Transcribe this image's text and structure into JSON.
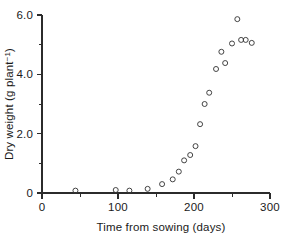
{
  "chart_data": {
    "type": "scatter",
    "title": "",
    "xlabel": "Time from sowing (days)",
    "ylabel": "Dry weight (g plant ⁻¹)",
    "ylabel_main": "Dry weight (g plant",
    "ylabel_sup": "−1",
    "ylabel_tail": ")",
    "xlim": [
      0,
      300
    ],
    "ylim": [
      0,
      6.0
    ],
    "grid": false,
    "legend": "none",
    "marker_style": "open-circle",
    "x_ticks_major": [
      0,
      100,
      200,
      300
    ],
    "x_ticklabels": [
      "0",
      "100",
      "200",
      "300"
    ],
    "x_ticks_minor": [
      50,
      150,
      250
    ],
    "y_ticks_major": [
      0,
      2.0,
      4.0,
      6.0
    ],
    "y_ticklabels": [
      "0",
      "2.0",
      "4.0",
      "6.0"
    ],
    "y_ticks_minor": [
      1.0,
      3.0,
      5.0
    ],
    "points": [
      {
        "x": 44,
        "y": 0.08
      },
      {
        "x": 97,
        "y": 0.1
      },
      {
        "x": 115,
        "y": 0.08
      },
      {
        "x": 139,
        "y": 0.14
      },
      {
        "x": 158,
        "y": 0.3
      },
      {
        "x": 172,
        "y": 0.46
      },
      {
        "x": 180,
        "y": 0.72
      },
      {
        "x": 187,
        "y": 1.1
      },
      {
        "x": 195,
        "y": 1.28
      },
      {
        "x": 202,
        "y": 1.58
      },
      {
        "x": 208,
        "y": 2.32
      },
      {
        "x": 214,
        "y": 3.0
      },
      {
        "x": 220,
        "y": 3.38
      },
      {
        "x": 229,
        "y": 4.18
      },
      {
        "x": 236,
        "y": 4.76
      },
      {
        "x": 241,
        "y": 4.38
      },
      {
        "x": 250,
        "y": 5.04
      },
      {
        "x": 257,
        "y": 5.86
      },
      {
        "x": 262,
        "y": 5.16
      },
      {
        "x": 268,
        "y": 5.16
      },
      {
        "x": 276,
        "y": 5.06
      }
    ]
  },
  "axis_colors": {
    "axis": "#2b2b2b",
    "marker": "#3a3a3a",
    "background": "#ffffff"
  }
}
